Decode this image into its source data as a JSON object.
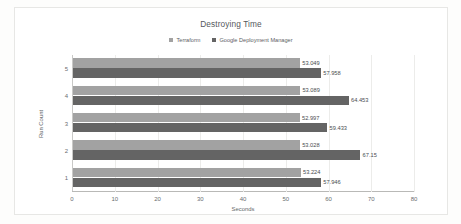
{
  "chart_data": {
    "type": "bar",
    "orientation": "horizontal",
    "title": "Destroying Time",
    "xlabel": "Seconds",
    "ylabel": "Run Count",
    "categories": [
      "1",
      "2",
      "3",
      "4",
      "5"
    ],
    "xlim": [
      0,
      80
    ],
    "xticks": [
      "0",
      "10",
      "20",
      "30",
      "40",
      "50",
      "60",
      "70",
      "80"
    ],
    "grid": true,
    "legend_position": "top",
    "series": [
      {
        "name": "Terraform",
        "color": "#a2a2a2",
        "values": [
          53.224,
          53.028,
          52.997,
          53.089,
          53.049
        ],
        "labels": [
          "53.224",
          "53.028",
          "52.997",
          "53.089",
          "53.049"
        ]
      },
      {
        "name": "Google Deployment Manager",
        "color": "#646464",
        "values": [
          57.946,
          67.15,
          59.433,
          64.453,
          57.958
        ],
        "labels": [
          "57.946",
          "67.15",
          "59.433",
          "64.453",
          "57.958"
        ]
      }
    ]
  }
}
